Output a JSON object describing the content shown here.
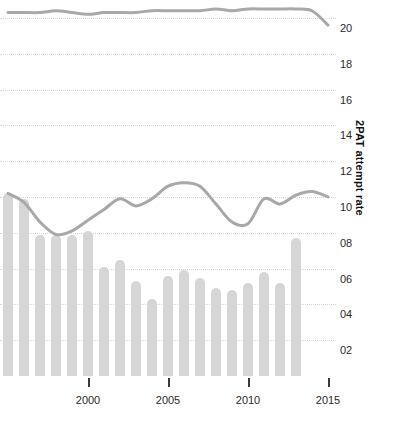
{
  "chart_data": {
    "type": "bar",
    "title": "",
    "subtitle": "",
    "xlabel": "",
    "ylabel": "2PAT attempt rate",
    "grid": true,
    "legend_position": "none",
    "xlim": [
      1994.5,
      2015.5
    ],
    "ylim": [
      0,
      21
    ],
    "y_ticks": [
      "02",
      "04",
      "06",
      "08",
      "10",
      "12",
      "14",
      "16",
      "18",
      "20"
    ],
    "y_tick_values": [
      2,
      4,
      6,
      8,
      10,
      12,
      14,
      16,
      18,
      20
    ],
    "x_ticks": [
      "2000",
      "2005",
      "2010",
      "2015"
    ],
    "x_tick_values": [
      2000,
      2005,
      2010,
      2015
    ],
    "categories": [
      1995,
      1996,
      1997,
      1998,
      1999,
      2000,
      2001,
      2002,
      2003,
      2004,
      2005,
      2006,
      2007,
      2008,
      2009,
      2010,
      2011,
      2012,
      2013,
      2014
    ],
    "bar_series": {
      "name": "2PAT attempt rate",
      "values": [
        10.2,
        9.9,
        7.9,
        7.9,
        7.9,
        8.1,
        6.1,
        6.5,
        5.3,
        4.3,
        5.6,
        5.9,
        5.5,
        4.9,
        4.8,
        5.2,
        5.8,
        5.2,
        7.7
      ]
    },
    "series": [
      {
        "name": "upper-line",
        "x": [
          1995,
          1996,
          1997,
          1998,
          1999,
          2000,
          2001,
          2002,
          2003,
          2004,
          2005,
          2006,
          2007,
          2008,
          2009,
          2010,
          2011,
          2012,
          2013,
          2014,
          2015
        ],
        "values": [
          20.3,
          20.3,
          20.3,
          20.4,
          20.3,
          20.2,
          20.3,
          20.3,
          20.3,
          20.4,
          20.4,
          20.4,
          20.4,
          20.5,
          20.4,
          20.5,
          20.5,
          20.5,
          20.5,
          20.4,
          19.6
        ]
      },
      {
        "name": "lower-line",
        "x": [
          1995,
          1996,
          1997,
          1998,
          1999,
          2000,
          2001,
          2002,
          2003,
          2004,
          2005,
          2006,
          2007,
          2008,
          2009,
          2010,
          2011,
          2012,
          2013,
          2014,
          2015
        ],
        "values": [
          10.2,
          9.7,
          8.6,
          7.9,
          8.1,
          8.7,
          9.3,
          9.9,
          9.5,
          9.9,
          10.6,
          10.8,
          10.6,
          9.6,
          8.6,
          8.5,
          9.9,
          9.6,
          10.1,
          10.3,
          10.0
        ]
      }
    ],
    "colors": {
      "bar": "#d6d6d6",
      "line": "#a8a8a8",
      "grid": "#d8d8d8",
      "text": "#2b2b2b",
      "background": "#ffffff"
    }
  }
}
